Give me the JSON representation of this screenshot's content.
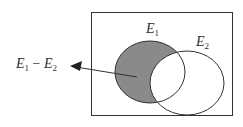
{
  "diagram": {
    "type": "venn",
    "sets": [
      {
        "name": "E1",
        "label_main": "E",
        "label_sub": "1"
      },
      {
        "name": "E2",
        "label_main": "E",
        "label_sub": "2"
      }
    ],
    "highlighted_region": "E1 minus E2",
    "annotation": {
      "main1": "E",
      "sub1": "1",
      "op": " − ",
      "main2": "E",
      "sub2": "2"
    },
    "colors": {
      "shade": "#8a8a8a",
      "stroke": "#333333",
      "background": "#ffffff"
    }
  }
}
